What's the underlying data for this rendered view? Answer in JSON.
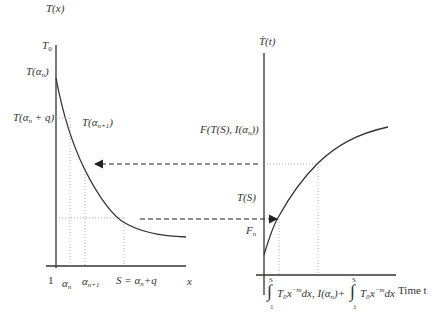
{
  "figure": {
    "left_panel": {
      "y_axis_label": "T(x)",
      "x_axis_label": "x",
      "y_ticks": {
        "t0": "T",
        "t0_sub": "0",
        "t_alpha_n": "T(α",
        "t_alpha_n_sub": "n",
        "t_alpha_n_close": ")",
        "t_alpha_n_q": "T(α",
        "t_alpha_n_q_sub": "n",
        "t_alpha_n_q_rest": " + q)"
      },
      "curve_label": {
        "text": "T(α",
        "sub": "n+1",
        "close": ")"
      },
      "x_ticks": {
        "one": "1",
        "alpha_n": "α",
        "alpha_n_sub": "n",
        "alpha_n1": "α",
        "alpha_n1_sub": "n+1",
        "s_eq": "S = α",
        "s_eq_sub": "n",
        "s_eq_rest": "+q"
      }
    },
    "right_panel": {
      "y_axis_label": "Ṫ(t)",
      "x_axis_label": "Time t",
      "y_ticks": {
        "f_label": "F(T(S), I(α",
        "f_label_sub": "n",
        "f_label_close": "))",
        "ts": "T(S)",
        "fn": "F",
        "fn_sub": "n"
      },
      "x_ticks": {
        "integral1": "T₀x",
        "integral1_exp": "−m",
        "integral1_rest": "dx, I(α",
        "integral1_sub": "n",
        "integral1_close": ")+",
        "integral2": "T₀x",
        "integral2_exp": "−m",
        "integral2_rest": "dx",
        "upper_limit": "S",
        "lower_limit": "1",
        "integral_sign": "∫"
      }
    },
    "colors": {
      "line": "#333333",
      "dotted": "#888888"
    }
  }
}
